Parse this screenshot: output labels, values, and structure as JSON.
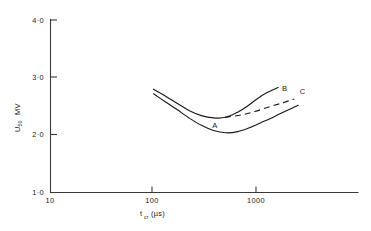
{
  "chart_data": {
    "type": "line",
    "title": "",
    "subtitle": "",
    "xlabel": "t_cr (µs)",
    "xlabel_main": "t",
    "xlabel_sub": "cr",
    "xlabel_unit": "(µs)",
    "ylabel": "U50  MV",
    "ylabel_main": "U",
    "ylabel_sub": "50",
    "ylabel_unit": "MV",
    "xscale": "log",
    "yscale": "linear",
    "xlim": [
      10,
      5000
    ],
    "ylim": [
      1.0,
      4.0
    ],
    "xticks": [
      10,
      100,
      1000
    ],
    "xtick_labels": [
      "10",
      "100",
      "1000"
    ],
    "yticks": [
      1.0,
      2.0,
      3.0,
      4.0
    ],
    "ytick_labels": [
      "1·0",
      "2·0",
      "3·0",
      "4·0"
    ],
    "grid": false,
    "legend": "inline-curve-labels",
    "series": [
      {
        "name": "A",
        "style": "solid",
        "label": "A",
        "label_x": 390,
        "label_y": 2.12,
        "x": [
          100,
          130,
          170,
          220,
          290,
          380,
          500,
          650,
          850,
          1100,
          1500,
          1900,
          2500
        ],
        "y": [
          2.72,
          2.58,
          2.44,
          2.3,
          2.17,
          2.08,
          2.04,
          2.06,
          2.13,
          2.22,
          2.33,
          2.42,
          2.52
        ]
      },
      {
        "name": "B",
        "style": "solid",
        "label": "B",
        "label_x": 1850,
        "label_y": 2.76,
        "x": [
          100,
          130,
          170,
          220,
          290,
          380,
          500,
          650,
          800,
          1000,
          1250,
          1600
        ],
        "y": [
          2.8,
          2.68,
          2.55,
          2.43,
          2.34,
          2.3,
          2.31,
          2.4,
          2.5,
          2.63,
          2.74,
          2.83
        ]
      },
      {
        "name": "C",
        "style": "dashed",
        "label": "C",
        "label_x": 2750,
        "label_y": 2.72,
        "x": [
          490,
          700,
          950,
          1300,
          1750,
          2300
        ],
        "y": [
          2.31,
          2.35,
          2.41,
          2.49,
          2.56,
          2.63
        ]
      }
    ],
    "colors": {
      "curve": "#1a1a1a",
      "axis": "#3a3a3a",
      "background": "#ffffff"
    }
  }
}
